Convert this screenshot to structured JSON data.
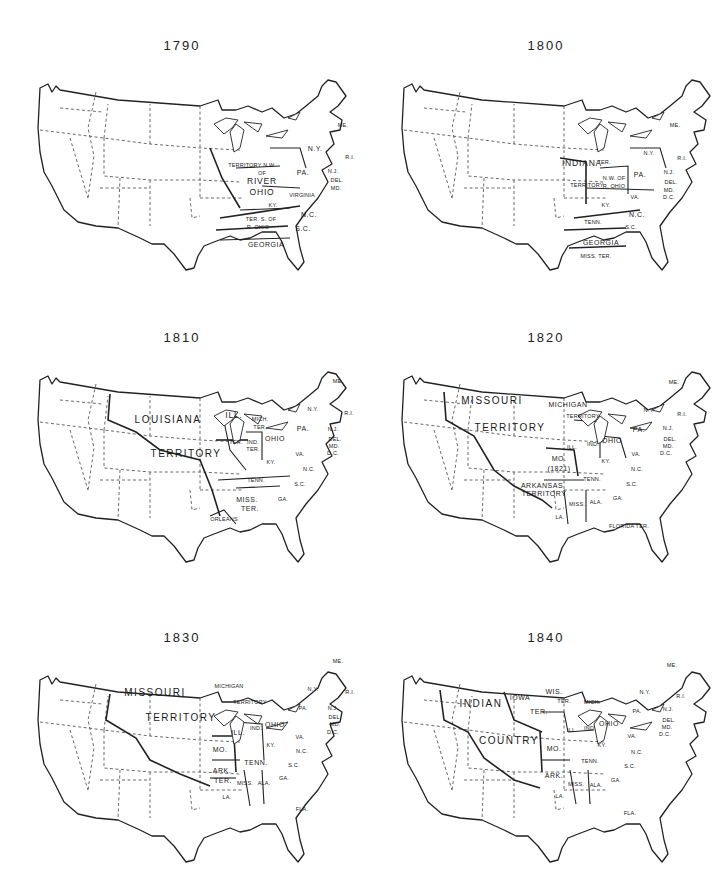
{
  "maps": [
    {
      "year": "1790",
      "position": {
        "left": 0,
        "top": 38
      },
      "big_territory": null,
      "labels": [
        {
          "text": "TERRITORY N.W.",
          "x": 252,
          "y": 118,
          "size": "tiny"
        },
        {
          "text": "OF",
          "x": 262,
          "y": 126,
          "size": "tiny"
        },
        {
          "text": "RIVER",
          "x": 262,
          "y": 133,
          "size": "med"
        },
        {
          "text": "OHIO",
          "x": 262,
          "y": 144,
          "size": "med"
        },
        {
          "text": "PA.",
          "x": 303,
          "y": 124,
          "size": ""
        },
        {
          "text": "N.Y.",
          "x": 315,
          "y": 100,
          "size": ""
        },
        {
          "text": "ME.",
          "x": 343,
          "y": 78,
          "size": "tiny"
        },
        {
          "text": "R.I.",
          "x": 350,
          "y": 110,
          "size": "tiny"
        },
        {
          "text": "N.J.",
          "x": 333,
          "y": 124,
          "size": "tiny"
        },
        {
          "text": "DEL.",
          "x": 337,
          "y": 133,
          "size": "tiny"
        },
        {
          "text": "MD.",
          "x": 336,
          "y": 141,
          "size": "tiny"
        },
        {
          "text": "VIRGINIA",
          "x": 302,
          "y": 148,
          "size": "tiny"
        },
        {
          "text": "KY.",
          "x": 273,
          "y": 158,
          "size": "tiny"
        },
        {
          "text": "N.C.",
          "x": 309,
          "y": 166,
          "size": ""
        },
        {
          "text": "TER. S. OF",
          "x": 261,
          "y": 172,
          "size": "tiny"
        },
        {
          "text": "R. OHIO",
          "x": 258,
          "y": 180,
          "size": "tiny"
        },
        {
          "text": "S.C.",
          "x": 303,
          "y": 180,
          "size": ""
        },
        {
          "text": "GEORGIA",
          "x": 266,
          "y": 196,
          "size": ""
        }
      ]
    },
    {
      "year": "1800",
      "position": {
        "left": 364,
        "top": 38
      },
      "big_territory": null,
      "labels": [
        {
          "text": "INDIANA",
          "x": 218,
          "y": 115,
          "size": "med"
        },
        {
          "text": "TER.",
          "x": 240,
          "y": 115,
          "size": "tiny"
        },
        {
          "text": "TERRITORY",
          "x": 223,
          "y": 138,
          "size": "tiny"
        },
        {
          "text": "N.W. OF",
          "x": 250,
          "y": 131,
          "size": "tiny"
        },
        {
          "text": "R. OHIO",
          "x": 250,
          "y": 139,
          "size": "tiny"
        },
        {
          "text": "PA.",
          "x": 276,
          "y": 126,
          "size": ""
        },
        {
          "text": "N.Y.",
          "x": 285,
          "y": 106,
          "size": "tiny"
        },
        {
          "text": "ME.",
          "x": 311,
          "y": 78,
          "size": "tiny"
        },
        {
          "text": "R.I.",
          "x": 318,
          "y": 111,
          "size": "tiny"
        },
        {
          "text": "N.J.",
          "x": 305,
          "y": 125,
          "size": "tiny"
        },
        {
          "text": "DEL.",
          "x": 307,
          "y": 135,
          "size": "tiny"
        },
        {
          "text": "MD.",
          "x": 305,
          "y": 143,
          "size": "tiny"
        },
        {
          "text": "D.C.",
          "x": 305,
          "y": 150,
          "size": "tiny"
        },
        {
          "text": "VA.",
          "x": 271,
          "y": 150,
          "size": "tiny"
        },
        {
          "text": "KY.",
          "x": 242,
          "y": 158,
          "size": "tiny"
        },
        {
          "text": "N.C.",
          "x": 273,
          "y": 166,
          "size": ""
        },
        {
          "text": "TENN.",
          "x": 229,
          "y": 175,
          "size": "tiny"
        },
        {
          "text": "S.C.",
          "x": 267,
          "y": 180,
          "size": "tiny"
        },
        {
          "text": "GEORGIA",
          "x": 237,
          "y": 194,
          "size": ""
        },
        {
          "text": "MISS. TER.",
          "x": 232,
          "y": 209,
          "size": "tiny"
        }
      ]
    },
    {
      "year": "1810",
      "position": {
        "left": 0,
        "top": 330
      },
      "big_territory": {
        "line1": "LOUISIANA",
        "line1_x": 168,
        "line1_y": 80,
        "line2": "TERRITORY",
        "line2_x": 186,
        "line2_y": 114
      },
      "labels": [
        {
          "text": "ILL.",
          "x": 234,
          "y": 75,
          "size": "med"
        },
        {
          "text": "MICH.",
          "x": 260,
          "y": 80,
          "size": "tiny"
        },
        {
          "text": "TER.",
          "x": 260,
          "y": 88,
          "size": "tiny"
        },
        {
          "text": "TER.",
          "x": 236,
          "y": 103,
          "size": "tiny"
        },
        {
          "text": "IND.",
          "x": 253,
          "y": 103,
          "size": "tiny"
        },
        {
          "text": "TER.",
          "x": 253,
          "y": 110,
          "size": "tiny"
        },
        {
          "text": "OHIO",
          "x": 275,
          "y": 98,
          "size": ""
        },
        {
          "text": "PA.",
          "x": 303,
          "y": 88,
          "size": ""
        },
        {
          "text": "N.Y.",
          "x": 313,
          "y": 70,
          "size": "tiny"
        },
        {
          "text": "ME.",
          "x": 338,
          "y": 42,
          "size": "tiny"
        },
        {
          "text": "R.I.",
          "x": 349,
          "y": 74,
          "size": "tiny"
        },
        {
          "text": "N.J.",
          "x": 333,
          "y": 90,
          "size": "tiny"
        },
        {
          "text": "DEL.",
          "x": 335,
          "y": 100,
          "size": "tiny"
        },
        {
          "text": "MD.",
          "x": 334,
          "y": 107,
          "size": "tiny"
        },
        {
          "text": "D.C.",
          "x": 333,
          "y": 114,
          "size": "tiny"
        },
        {
          "text": "VA.",
          "x": 300,
          "y": 115,
          "size": "tiny"
        },
        {
          "text": "KY.",
          "x": 271,
          "y": 123,
          "size": "tiny"
        },
        {
          "text": "N.C.",
          "x": 309,
          "y": 130,
          "size": "tiny"
        },
        {
          "text": "TENN.",
          "x": 256,
          "y": 141,
          "size": "tiny"
        },
        {
          "text": "S.C.",
          "x": 300,
          "y": 145,
          "size": "tiny"
        },
        {
          "text": "MISS.",
          "x": 247,
          "y": 159,
          "size": ""
        },
        {
          "text": "TER.",
          "x": 250,
          "y": 168,
          "size": ""
        },
        {
          "text": "GA.",
          "x": 283,
          "y": 160,
          "size": "tiny"
        },
        {
          "text": "ORLEANS",
          "x": 224,
          "y": 180,
          "size": "tiny"
        }
      ]
    },
    {
      "year": "1820",
      "position": {
        "left": 364,
        "top": 330
      },
      "big_territory": {
        "line1": "MISSOURI",
        "line1_x": 128,
        "line1_y": 61,
        "line2": "TERRITORY",
        "line2_x": 146,
        "line2_y": 88
      },
      "labels": [
        {
          "text": "MICHIGAN",
          "x": 204,
          "y": 64,
          "size": ""
        },
        {
          "text": "TERRITORY",
          "x": 219,
          "y": 77,
          "size": "tiny"
        },
        {
          "text": "ILL.",
          "x": 208,
          "y": 108,
          "size": "tiny"
        },
        {
          "text": "IND.",
          "x": 229,
          "y": 105,
          "size": "tiny"
        },
        {
          "text": "OHIO",
          "x": 248,
          "y": 100,
          "size": ""
        },
        {
          "text": "MO.",
          "x": 195,
          "y": 118,
          "size": ""
        },
        {
          "text": "(1821)",
          "x": 195,
          "y": 128,
          "size": ""
        },
        {
          "text": "KY.",
          "x": 242,
          "y": 122,
          "size": "tiny"
        },
        {
          "text": "VA.",
          "x": 272,
          "y": 115,
          "size": "tiny"
        },
        {
          "text": "PA.",
          "x": 275,
          "y": 89,
          "size": ""
        },
        {
          "text": "N.Y.",
          "x": 285,
          "y": 71,
          "size": "tiny"
        },
        {
          "text": "ME.",
          "x": 310,
          "y": 43,
          "size": "tiny"
        },
        {
          "text": "R.I.",
          "x": 318,
          "y": 75,
          "size": "tiny"
        },
        {
          "text": "N.J.",
          "x": 304,
          "y": 89,
          "size": "tiny"
        },
        {
          "text": "DEL.",
          "x": 306,
          "y": 100,
          "size": "tiny"
        },
        {
          "text": "MD.",
          "x": 304,
          "y": 107,
          "size": "tiny"
        },
        {
          "text": "D.C.",
          "x": 302,
          "y": 114,
          "size": "tiny"
        },
        {
          "text": "N.C.",
          "x": 273,
          "y": 130,
          "size": "tiny"
        },
        {
          "text": "TENN.",
          "x": 228,
          "y": 140,
          "size": "tiny"
        },
        {
          "text": "ARKANSAS",
          "x": 178,
          "y": 145,
          "size": ""
        },
        {
          "text": "TERRITORY",
          "x": 180,
          "y": 153,
          "size": ""
        },
        {
          "text": "S.C.",
          "x": 268,
          "y": 145,
          "size": "tiny"
        },
        {
          "text": "GA.",
          "x": 254,
          "y": 159,
          "size": "tiny"
        },
        {
          "text": "MISS.",
          "x": 213,
          "y": 165,
          "size": "tiny"
        },
        {
          "text": "ALA.",
          "x": 232,
          "y": 163,
          "size": "tiny"
        },
        {
          "text": "LA.",
          "x": 196,
          "y": 178,
          "size": "tiny"
        },
        {
          "text": "FLORIDA TER.",
          "x": 265,
          "y": 187,
          "size": "tiny"
        }
      ]
    },
    {
      "year": "1830",
      "position": {
        "left": 0,
        "top": 630
      },
      "big_territory": {
        "line1": "MISSOURI",
        "line1_x": 155,
        "line1_y": 53,
        "line2": "TERRITORY",
        "line2_x": 181,
        "line2_y": 78
      },
      "labels": [
        {
          "text": "MICHIGAN",
          "x": 229,
          "y": 47,
          "size": "tiny"
        },
        {
          "text": "TERRITORY",
          "x": 250,
          "y": 63,
          "size": "tiny"
        },
        {
          "text": "ILL.",
          "x": 238,
          "y": 92,
          "size": ""
        },
        {
          "text": "IND.",
          "x": 256,
          "y": 89,
          "size": "tiny"
        },
        {
          "text": "OHIO",
          "x": 275,
          "y": 84,
          "size": ""
        },
        {
          "text": "MO.",
          "x": 220,
          "y": 109,
          "size": ""
        },
        {
          "text": "KY.",
          "x": 271,
          "y": 106,
          "size": "tiny"
        },
        {
          "text": "VA.",
          "x": 300,
          "y": 98,
          "size": "tiny"
        },
        {
          "text": "PA.",
          "x": 303,
          "y": 69,
          "size": "tiny"
        },
        {
          "text": "N.Y.",
          "x": 313,
          "y": 50,
          "size": "tiny"
        },
        {
          "text": "ME.",
          "x": 338,
          "y": 22,
          "size": "tiny"
        },
        {
          "text": "R.I.",
          "x": 350,
          "y": 53,
          "size": "tiny"
        },
        {
          "text": "N.J.",
          "x": 333,
          "y": 69,
          "size": "tiny"
        },
        {
          "text": "DEL.",
          "x": 335,
          "y": 78,
          "size": "tiny"
        },
        {
          "text": "MD.",
          "x": 335,
          "y": 85,
          "size": "tiny"
        },
        {
          "text": "D.C.",
          "x": 333,
          "y": 93,
          "size": "tiny"
        },
        {
          "text": "N.C.",
          "x": 302,
          "y": 112,
          "size": "tiny"
        },
        {
          "text": "TENN.",
          "x": 256,
          "y": 122,
          "size": ""
        },
        {
          "text": "ARK.",
          "x": 222,
          "y": 130,
          "size": ""
        },
        {
          "text": "TER.",
          "x": 223,
          "y": 140,
          "size": ""
        },
        {
          "text": "S.C.",
          "x": 294,
          "y": 126,
          "size": "tiny"
        },
        {
          "text": "MISS.",
          "x": 245,
          "y": 144,
          "size": "tiny"
        },
        {
          "text": "ALA.",
          "x": 264,
          "y": 144,
          "size": "tiny"
        },
        {
          "text": "GA.",
          "x": 284,
          "y": 139,
          "size": "tiny"
        },
        {
          "text": "LA.",
          "x": 227,
          "y": 158,
          "size": "tiny"
        },
        {
          "text": "FLA.",
          "x": 302,
          "y": 170,
          "size": "tiny"
        }
      ]
    },
    {
      "year": "1840",
      "position": {
        "left": 364,
        "top": 630
      },
      "big_territory": {
        "line1": "INDIAN",
        "line1_x": 117,
        "line1_y": 64,
        "line2": "COUNTRY",
        "line2_x": 145,
        "line2_y": 101
      },
      "labels": [
        {
          "text": "IOWA",
          "x": 156,
          "y": 57,
          "size": ""
        },
        {
          "text": "TER.",
          "x": 175,
          "y": 71,
          "size": ""
        },
        {
          "text": "WIS.",
          "x": 190,
          "y": 51,
          "size": ""
        },
        {
          "text": "TER.",
          "x": 200,
          "y": 62,
          "size": "tiny"
        },
        {
          "text": "MICH.",
          "x": 228,
          "y": 63,
          "size": "tiny"
        },
        {
          "text": "ILL.",
          "x": 208,
          "y": 91,
          "size": "tiny"
        },
        {
          "text": "IND.",
          "x": 226,
          "y": 89,
          "size": "tiny"
        },
        {
          "text": "OHIO",
          "x": 245,
          "y": 83,
          "size": ""
        },
        {
          "text": "MO.",
          "x": 190,
          "y": 108,
          "size": ""
        },
        {
          "text": "KY.",
          "x": 238,
          "y": 106,
          "size": "tiny"
        },
        {
          "text": "VA.",
          "x": 268,
          "y": 97,
          "size": "tiny"
        },
        {
          "text": "PA.",
          "x": 273,
          "y": 72,
          "size": "tiny"
        },
        {
          "text": "N.Y.",
          "x": 281,
          "y": 53,
          "size": "tiny"
        },
        {
          "text": "ME.",
          "x": 308,
          "y": 26,
          "size": "tiny"
        },
        {
          "text": "R.I.",
          "x": 317,
          "y": 57,
          "size": "tiny"
        },
        {
          "text": "N.J.",
          "x": 304,
          "y": 70,
          "size": "tiny"
        },
        {
          "text": "DEL.",
          "x": 305,
          "y": 81,
          "size": "tiny"
        },
        {
          "text": "MD.",
          "x": 303,
          "y": 88,
          "size": "tiny"
        },
        {
          "text": "D.C.",
          "x": 301,
          "y": 95,
          "size": "tiny"
        },
        {
          "text": "N.C.",
          "x": 273,
          "y": 113,
          "size": "tiny"
        },
        {
          "text": "TENN.",
          "x": 226,
          "y": 122,
          "size": "tiny"
        },
        {
          "text": "ARK.",
          "x": 190,
          "y": 135,
          "size": ""
        },
        {
          "text": "S.C.",
          "x": 266,
          "y": 127,
          "size": "tiny"
        },
        {
          "text": "MISS.",
          "x": 212,
          "y": 145,
          "size": "tiny"
        },
        {
          "text": "ALA.",
          "x": 232,
          "y": 146,
          "size": "tiny"
        },
        {
          "text": "GA.",
          "x": 252,
          "y": 141,
          "size": "tiny"
        },
        {
          "text": "LA.",
          "x": 196,
          "y": 157,
          "size": "tiny"
        },
        {
          "text": "FLA.",
          "x": 266,
          "y": 174,
          "size": "tiny"
        }
      ]
    }
  ]
}
